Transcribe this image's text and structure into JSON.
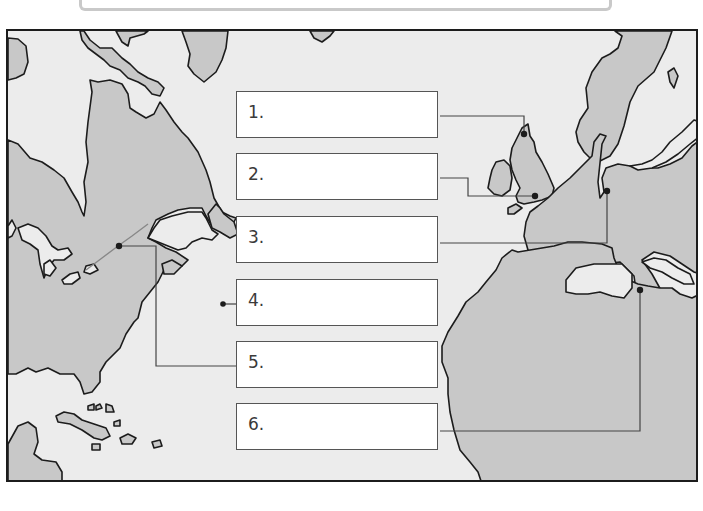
{
  "worksheet": {
    "title": "North Atlantic map labeling activity",
    "map": {
      "land_color": "#c8c8c8",
      "water_color": "#ececec",
      "coastline_color": "#1c1c1c",
      "leader_line_color": "#444444"
    },
    "labels": [
      {
        "number": "1.",
        "answer": "",
        "points_to": "northern Britain"
      },
      {
        "number": "2.",
        "answer": "",
        "points_to": "southern Britain"
      },
      {
        "number": "3.",
        "answer": "",
        "points_to": "France"
      },
      {
        "number": "4.",
        "answer": "",
        "points_to": "Atlantic Ocean"
      },
      {
        "number": "5.",
        "answer": "",
        "points_to": "St. Lawrence River"
      },
      {
        "number": "6.",
        "answer": "",
        "points_to": "Italy"
      }
    ]
  }
}
